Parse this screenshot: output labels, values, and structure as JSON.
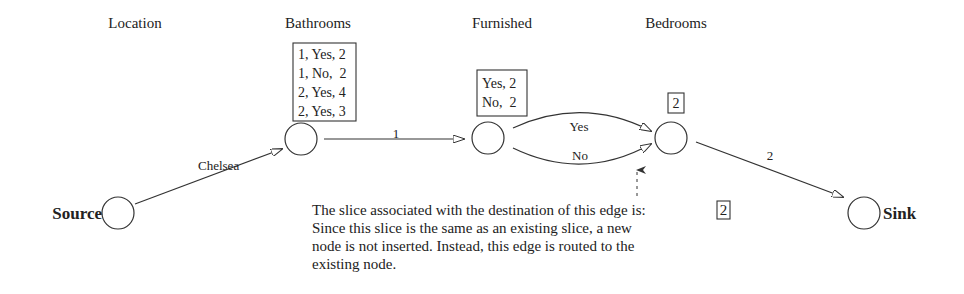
{
  "columns": [
    {
      "label": "Location",
      "x": 135
    },
    {
      "label": "Bathrooms",
      "x": 318
    },
    {
      "label": "Furnished",
      "x": 502
    },
    {
      "label": "Bedrooms",
      "x": 676
    }
  ],
  "nodes": {
    "source": {
      "label": "Source"
    },
    "bathrooms": {
      "slice": [
        "1, Yes, 2",
        "1, No,  2",
        "2, Yes, 4",
        "2, Yes, 3"
      ]
    },
    "furnished": {
      "slice": [
        "Yes, 2",
        "No,  2"
      ]
    },
    "bedrooms": {
      "slice": [
        "2"
      ]
    },
    "sink": {
      "label": "Sink"
    }
  },
  "edges": {
    "source_to_bathrooms": "Chelsea",
    "bathrooms_to_furnished": "1",
    "furnished_to_bedrooms_yes": "Yes",
    "furnished_to_bedrooms_no": "No",
    "bedrooms_to_sink": "2"
  },
  "annotation": {
    "lines": [
      "The slice associated with the destination of this edge is:",
      "Since this slice is the same as an existing slice, a new",
      "node is not inserted. Instead, this edge is routed to the",
      "existing node."
    ],
    "slice_value": "2"
  }
}
